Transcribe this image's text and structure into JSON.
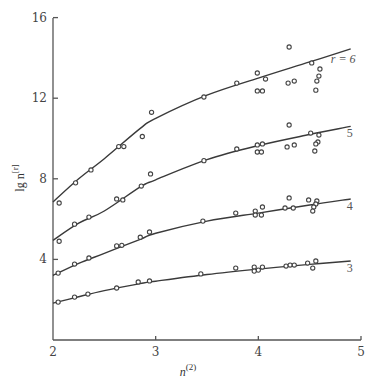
{
  "chart_data": {
    "type": "scatter",
    "title": "",
    "xlabel": "n^(2)",
    "ylabel": "lg n^[r]",
    "xlim": [
      2,
      5
    ],
    "ylim": [
      0,
      16
    ],
    "x_ticks": [
      "2",
      "3",
      "4",
      "5"
    ],
    "y_ticks": [
      "4",
      "8",
      "12",
      "16"
    ],
    "grid": false,
    "legend": "inline labels at curve ends",
    "series": [
      {
        "name": "r = 6",
        "label": "r = 6",
        "fit_curve": {
          "x": [
            2.0,
            2.25,
            2.5,
            2.85,
            3.0,
            3.5,
            4.0,
            4.5,
            4.9
          ],
          "y": [
            6.85,
            8.0,
            9.0,
            10.5,
            11.0,
            12.15,
            13.0,
            13.8,
            14.45
          ]
        },
        "points": [
          [
            2.06,
            6.8
          ],
          [
            2.22,
            7.8
          ],
          [
            2.37,
            8.44
          ],
          [
            2.64,
            9.6
          ],
          [
            2.69,
            9.6
          ],
          [
            2.87,
            10.1
          ],
          [
            2.96,
            11.3
          ],
          [
            3.47,
            12.06
          ],
          [
            3.79,
            12.75
          ],
          [
            3.99,
            13.25
          ],
          [
            4.07,
            12.95
          ],
          [
            3.99,
            12.36
          ],
          [
            4.04,
            12.36
          ],
          [
            4.29,
            12.75
          ],
          [
            4.35,
            12.85
          ],
          [
            4.3,
            14.54
          ],
          [
            4.52,
            13.75
          ],
          [
            4.6,
            13.45
          ],
          [
            4.59,
            13.1
          ],
          [
            4.57,
            12.85
          ],
          [
            4.56,
            12.4
          ]
        ]
      },
      {
        "name": "r = 5",
        "label": "5",
        "fit_curve": {
          "x": [
            2.0,
            2.25,
            2.5,
            2.85,
            3.0,
            3.5,
            4.0,
            4.5,
            4.9
          ],
          "y": [
            4.95,
            5.8,
            6.4,
            7.6,
            7.95,
            8.95,
            9.65,
            10.2,
            10.6
          ]
        },
        "points": [
          [
            2.06,
            4.9
          ],
          [
            2.21,
            5.75
          ],
          [
            2.35,
            6.1
          ],
          [
            2.62,
            7.0
          ],
          [
            2.68,
            6.95
          ],
          [
            2.86,
            7.64
          ],
          [
            2.95,
            8.24
          ],
          [
            3.47,
            8.9
          ],
          [
            3.79,
            9.48
          ],
          [
            3.99,
            9.68
          ],
          [
            4.04,
            9.73
          ],
          [
            3.99,
            9.33
          ],
          [
            4.03,
            9.33
          ],
          [
            4.28,
            9.58
          ],
          [
            4.35,
            9.68
          ],
          [
            4.3,
            10.67
          ],
          [
            4.51,
            10.27
          ],
          [
            4.59,
            10.17
          ],
          [
            4.58,
            9.83
          ],
          [
            4.56,
            9.73
          ],
          [
            4.55,
            9.38
          ]
        ]
      },
      {
        "name": "r = 4",
        "label": "4",
        "fit_curve": {
          "x": [
            2.0,
            2.25,
            2.5,
            2.85,
            3.0,
            3.5,
            4.0,
            4.5,
            4.9
          ],
          "y": [
            3.2,
            3.8,
            4.3,
            5.0,
            5.3,
            5.9,
            6.3,
            6.7,
            7.0
          ]
        },
        "points": [
          [
            2.05,
            3.32
          ],
          [
            2.21,
            3.77
          ],
          [
            2.35,
            4.07
          ],
          [
            2.62,
            4.67
          ],
          [
            2.67,
            4.7
          ],
          [
            2.85,
            5.1
          ],
          [
            2.94,
            5.36
          ],
          [
            3.46,
            5.9
          ],
          [
            3.78,
            6.3
          ],
          [
            3.97,
            6.4
          ],
          [
            4.04,
            6.6
          ],
          [
            3.97,
            6.2
          ],
          [
            4.03,
            6.2
          ],
          [
            4.26,
            6.55
          ],
          [
            4.34,
            6.55
          ],
          [
            4.3,
            7.05
          ],
          [
            4.49,
            6.95
          ],
          [
            4.57,
            6.9
          ],
          [
            4.56,
            6.75
          ],
          [
            4.54,
            6.6
          ],
          [
            4.53,
            6.4
          ]
        ]
      },
      {
        "name": "r = 3",
        "label": "3",
        "fit_curve": {
          "x": [
            2.0,
            2.25,
            2.5,
            2.85,
            3.0,
            3.5,
            4.0,
            4.5,
            4.9
          ],
          "y": [
            1.83,
            2.15,
            2.45,
            2.8,
            2.92,
            3.25,
            3.52,
            3.75,
            3.92
          ]
        },
        "points": [
          [
            2.05,
            1.88
          ],
          [
            2.21,
            2.13
          ],
          [
            2.34,
            2.28
          ],
          [
            2.62,
            2.58
          ],
          [
            2.83,
            2.88
          ],
          [
            2.94,
            2.93
          ],
          [
            3.44,
            3.28
          ],
          [
            3.78,
            3.57
          ],
          [
            3.96,
            3.62
          ],
          [
            4.0,
            3.47
          ],
          [
            3.96,
            3.42
          ],
          [
            4.04,
            3.62
          ],
          [
            4.27,
            3.67
          ],
          [
            4.31,
            3.72
          ],
          [
            4.35,
            3.72
          ],
          [
            4.48,
            3.82
          ],
          [
            4.56,
            3.92
          ],
          [
            4.53,
            3.57
          ]
        ]
      }
    ]
  },
  "labels": {
    "x_axis_base": "n",
    "x_axis_sup": "(2)",
    "y_axis_base": "lg n",
    "y_axis_sup": "[r]",
    "series_labels": [
      "r = 6",
      "5",
      "4",
      "3"
    ]
  }
}
